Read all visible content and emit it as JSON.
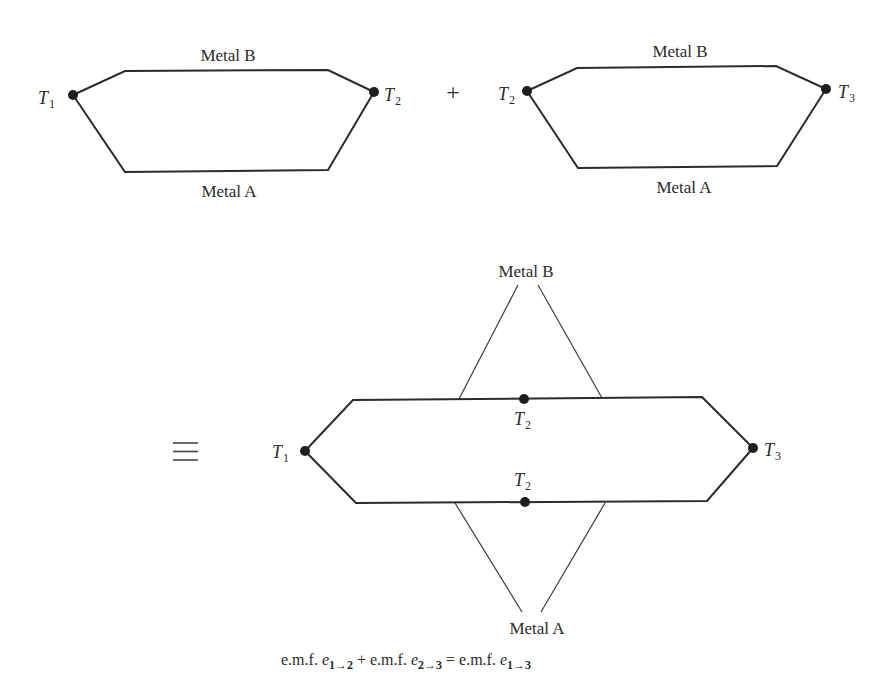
{
  "diagram": {
    "colors": {
      "wire": "#2b2b2b",
      "junction": "#1e1e1e",
      "text": "#2a2a2a",
      "background": "#ffffff"
    },
    "operators": {
      "plus": "+",
      "equivalent": "≡"
    },
    "circuit_1": {
      "top_label": "Metal B",
      "bottom_label": "Metal A",
      "left_junction": {
        "symbol": "T",
        "subscript": "1"
      },
      "right_junction": {
        "symbol": "T",
        "subscript": "2"
      }
    },
    "circuit_2": {
      "top_label": "Metal B",
      "bottom_label": "Metal A",
      "left_junction": {
        "symbol": "T",
        "subscript": "2"
      },
      "right_junction": {
        "symbol": "T",
        "subscript": "3"
      }
    },
    "combined": {
      "top_lead_label": "Metal B",
      "bottom_lead_label": "Metal A",
      "left_junction": {
        "symbol": "T",
        "subscript": "1"
      },
      "right_junction": {
        "symbol": "T",
        "subscript": "3"
      },
      "upper_mid_junction": {
        "symbol": "T",
        "subscript": "2"
      },
      "lower_mid_junction": {
        "symbol": "T",
        "subscript": "2"
      }
    },
    "equation": {
      "term1_prefix": "e.m.f. ",
      "term1_var": "e",
      "term1_sub": "1→2",
      "plus": " + ",
      "term2_prefix": "e.m.f. ",
      "term2_var": "e",
      "term2_sub": "2→3",
      "equals": " = ",
      "term3_prefix": "e.m.f. ",
      "term3_var": "e",
      "term3_sub": "1→3"
    }
  }
}
